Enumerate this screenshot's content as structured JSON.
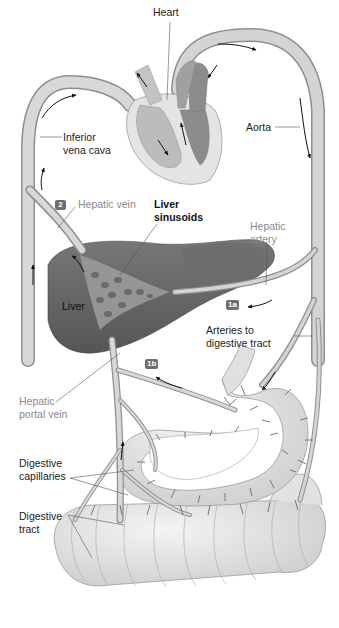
{
  "figure": {
    "labels": {
      "heart": "Heart",
      "aorta": "Aorta",
      "inferior_vena_cava": [
        "Inferior",
        "vena cava"
      ],
      "hepatic_vein": "Hepatic vein",
      "liver_sinusoids": [
        "Liver",
        "sinusoids"
      ],
      "hepatic_artery": [
        "Hepatic",
        "artery"
      ],
      "liver": "Liver",
      "arteries_to_digestive_tract": [
        "Arteries to",
        "digestive tract"
      ],
      "hepatic_portal_vein": [
        "Hepatic",
        "portal vein"
      ],
      "digestive_capillaries": [
        "Digestive",
        "capillaries"
      ],
      "digestive_tract": [
        "Digestive",
        "tract"
      ]
    },
    "step_badges": {
      "hepatic_vein_step": "2",
      "hepatic_artery_step": "1a",
      "portal_vein_step": "1b"
    },
    "colors": {
      "vessel_fill": "#d4d4d4",
      "vessel_edge": "#8e8e8e",
      "liver_fill": "#6a6a6a",
      "liver_dark": "#545454",
      "heart_light": "#e2e2e2",
      "heart_mid": "#bcbcbc",
      "heart_dark": "#8c8c8c",
      "gut_fill": "#e6e6e6",
      "capillary": "#6c6c6c",
      "label_grey": "#8a8a8a",
      "badge_fill": "#6e6e6e",
      "arrow": "#111111"
    }
  }
}
